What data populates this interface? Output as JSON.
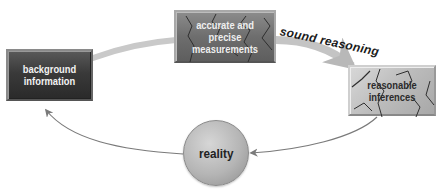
{
  "diagram": {
    "nodes": [
      {
        "id": "background",
        "label_line1": "background",
        "label_line2": "information",
        "shape": "dark-rectangle"
      },
      {
        "id": "measurements",
        "label_line1": "accurate and precise",
        "label_line2": "measurements",
        "shape": "cracked-rectangle"
      },
      {
        "id": "inferences",
        "label_line1": "reasonable",
        "label_line2": "inferences",
        "shape": "cracked-light-rectangle"
      },
      {
        "id": "reality",
        "label": "reality",
        "shape": "circle"
      }
    ],
    "edges": [
      {
        "from": "background",
        "to": "measurements",
        "style": "thick-gray-swoosh"
      },
      {
        "from": "measurements",
        "to": "inferences",
        "label": "sound reasoning",
        "style": "thick-gray-swoosh-arrow"
      },
      {
        "from": "inferences",
        "to": "reality",
        "style": "thin-curved-arrow"
      },
      {
        "from": "reality",
        "to": "background",
        "style": "thin-curved-arrow"
      }
    ],
    "colors": {
      "dark_box": "#3a3a3a",
      "mid_box": "#6e6e6e",
      "light_box": "#bcbcbc",
      "circle": "#b5b5b5",
      "arrow": "#7a7a7a",
      "swoosh": "#c8c8c8"
    }
  }
}
